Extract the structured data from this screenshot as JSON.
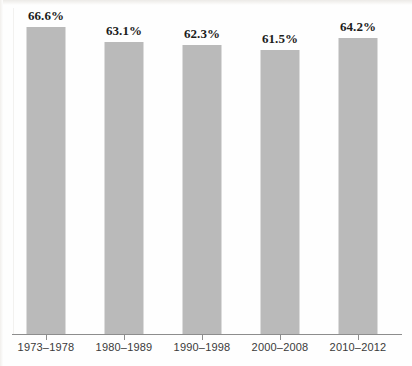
{
  "chart_data": {
    "type": "bar",
    "title": "",
    "subtitle": "",
    "xlabel": "",
    "ylabel": "",
    "categories": [
      "1973–1978",
      "1980–1989",
      "1990–1998",
      "2000–2008",
      "2010–2012"
    ],
    "values": [
      66.6,
      63.1,
      62.3,
      61.5,
      64.2
    ],
    "value_labels": [
      "66.6%",
      "63.1%",
      "62.3%",
      "61.5%",
      "64.2%"
    ],
    "series": [
      {
        "name": "",
        "values": [
          66.6,
          63.1,
          62.3,
          61.5,
          64.2
        ]
      }
    ],
    "ylim": [
      58.8,
      67.4
    ],
    "y_axis_visible": false,
    "y_tick_labels": [],
    "grid": false,
    "legend": false,
    "legend_position": "none",
    "bar_color": "#bababa",
    "axis_color": "#8d8d8d",
    "label_color": "#1c1c1c",
    "tick_label_color": "#3a3a3a",
    "background_color": "#fefefe",
    "annotations": []
  },
  "bars": [
    {
      "category": "1973–1978",
      "value": 66.6,
      "value_label": "66.6%",
      "left": 10,
      "bar_top": 27,
      "label_top": 8
    },
    {
      "category": "1980–1989",
      "value": 63.1,
      "value_label": "63.1%",
      "left": 88,
      "bar_top": 42,
      "label_top": 23
    },
    {
      "category": "1990–1998",
      "value": 62.3,
      "value_label": "62.3%",
      "left": 166,
      "bar_top": 45,
      "label_top": 26
    },
    {
      "category": "2000–2008",
      "value": 61.5,
      "value_label": "61.5%",
      "left": 244,
      "bar_top": 50,
      "label_top": 31
    },
    {
      "category": "2010–2012",
      "value": 64.2,
      "value_label": "64.2%",
      "left": 322,
      "bar_top": 38,
      "label_top": 19
    }
  ]
}
